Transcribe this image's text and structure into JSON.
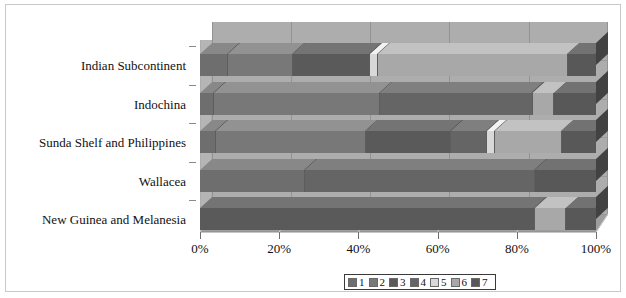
{
  "chart_data": {
    "type": "bar",
    "subtype": "stacked-bar-horizontal-3d",
    "title": "",
    "xlabel": "",
    "ylabel": "",
    "orientation": "horizontal",
    "stacked": true,
    "normalized": true,
    "xlim": [
      0,
      100
    ],
    "xunit": "%",
    "grid": true,
    "legend_position": "bottom-right",
    "categories": [
      "Indian Subcontinent",
      "Indochina",
      "Sunda Shelf and Philippines",
      "Wallacea",
      "New Guinea and Melanesia"
    ],
    "series": [
      {
        "name": "1",
        "color": "#6e6e6e",
        "values": [
          7.0,
          3.5,
          4.0,
          26.5,
          0.0
        ]
      },
      {
        "name": "2",
        "color": "#787878",
        "values": [
          16.5,
          42.0,
          38.0,
          0.0,
          0.0
        ]
      },
      {
        "name": "3",
        "color": "#5a5a5a",
        "values": [
          19.5,
          0.0,
          21.5,
          0.0,
          84.5
        ]
      },
      {
        "name": "4",
        "color": "#656565",
        "values": [
          0.0,
          38.5,
          9.0,
          58.0,
          0.0
        ]
      },
      {
        "name": "5",
        "color": "#d8d8d8",
        "values": [
          2.0,
          0.0,
          2.0,
          0.0,
          0.0
        ]
      },
      {
        "name": "6",
        "color": "#a8a8a8",
        "values": [
          48.0,
          5.5,
          17.0,
          0.0,
          8.0
        ]
      },
      {
        "name": "7",
        "color": "#585858",
        "values": [
          7.0,
          10.5,
          8.5,
          15.5,
          7.5
        ]
      }
    ],
    "x_ticks": [
      {
        "value": 0,
        "label": "0%"
      },
      {
        "value": 20,
        "label": "20%"
      },
      {
        "value": 40,
        "label": "40%"
      },
      {
        "value": 60,
        "label": "60%"
      },
      {
        "value": 80,
        "label": "80%"
      },
      {
        "value": 100,
        "label": "100%"
      }
    ],
    "legend_entries": [
      {
        "label": "1",
        "color": "#6e6e6e"
      },
      {
        "label": "2",
        "color": "#787878"
      },
      {
        "label": "3",
        "color": "#5a5a5a"
      },
      {
        "label": "4",
        "color": "#656565"
      },
      {
        "label": "5",
        "color": "#d8d8d8"
      },
      {
        "label": "6",
        "color": "#a8a8a8"
      },
      {
        "label": "7",
        "color": "#585858"
      }
    ],
    "colors": {
      "plot_back_wall": "#adadad",
      "floor": "#9e9e9e",
      "side_wall": "#b5b5b5",
      "gridline": "#939393",
      "figure_background": "#ffffff",
      "text": "#111111"
    }
  }
}
